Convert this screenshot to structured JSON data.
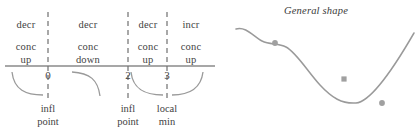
{
  "figure": {
    "width": 416,
    "height": 131,
    "line_color": "#8a8a8a",
    "text_color": "#3f3f3f",
    "marker_color": "#a0a0a0"
  },
  "sign_chart": {
    "axis": {
      "x1": 5,
      "x2": 215,
      "y": 66
    },
    "critical_points": [
      {
        "value": "0",
        "x": 48
      },
      {
        "value": "2",
        "x": 128
      },
      {
        "value": "3",
        "x": 167
      }
    ],
    "intervals": [
      {
        "monotonicity": "decr",
        "concavity": "conc\nup",
        "center_x": 26
      },
      {
        "monotonicity": "decr",
        "concavity": "conc\ndown",
        "center_x": 88
      },
      {
        "monotonicity": "decr",
        "concavity": "conc\nup",
        "center_x": 147
      },
      {
        "monotonicity": "incr",
        "concavity": "conc\nup",
        "center_x": 191
      }
    ],
    "point_labels": [
      {
        "text": "infl\npoint",
        "center_x": 48
      },
      {
        "text": "infl\npoint",
        "center_x": 128
      },
      {
        "text": "local\nmin",
        "center_x": 167
      }
    ],
    "shape_arcs": [
      {
        "name": "decreasing-concave-up-arc",
        "d": "M 12,72 C 14,90 26,95 43,95"
      },
      {
        "name": "decreasing-concave-down-arc",
        "d": "M 72,72 C 90,73 98,80 100,96"
      },
      {
        "name": "decreasing-concave-up-arc-2",
        "d": "M 131,72 C 133,90 146,95 163,95"
      },
      {
        "name": "increasing-concave-up-arc",
        "d": "M 172,95 C 190,95 201,88 203,72"
      }
    ]
  },
  "curve": {
    "title": "General shape",
    "path": "M 20,29 C 30,26 38,37 46,41 C 54,45 62,43 70,47 C 80,52 92,72 104,85 C 116,98 126,104 140,103 C 152,102 172,78 198,33",
    "markers": [
      {
        "name": "inflection-point-marker",
        "cx": 59,
        "cy": 43,
        "shape": "circle"
      },
      {
        "name": "inflection-point-marker",
        "cx": 128,
        "cy": 79,
        "shape": "square"
      },
      {
        "name": "local-min-marker",
        "cx": 166,
        "cy": 103,
        "shape": "circle"
      }
    ]
  }
}
